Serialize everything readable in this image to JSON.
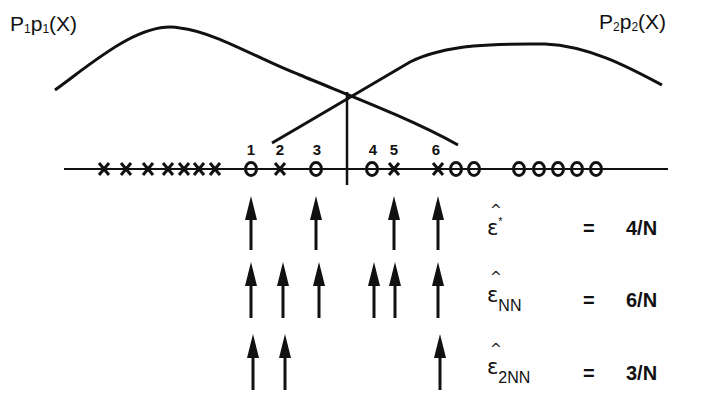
{
  "diagram": {
    "curve_labels": {
      "class1": {
        "P": "P",
        "P_sub": "1",
        "p": "p",
        "p_sub": "1",
        "arg": "(X)"
      },
      "class2": {
        "P": "P",
        "P_sub": "2",
        "p": "p",
        "p_sub": "2",
        "arg": "(X)"
      }
    },
    "axis_samples": [
      {
        "x": 104,
        "type": "X"
      },
      {
        "x": 126,
        "type": "X"
      },
      {
        "x": 148,
        "type": "X"
      },
      {
        "x": 168,
        "type": "X"
      },
      {
        "x": 184,
        "type": "X"
      },
      {
        "x": 199,
        "type": "X"
      },
      {
        "x": 215,
        "type": "X"
      },
      {
        "x": 251,
        "type": "O"
      },
      {
        "x": 280,
        "type": "X"
      },
      {
        "x": 316,
        "type": "O"
      },
      {
        "x": 372,
        "type": "O"
      },
      {
        "x": 394,
        "type": "X"
      },
      {
        "x": 438,
        "type": "X"
      },
      {
        "x": 456,
        "type": "O"
      },
      {
        "x": 474,
        "type": "O"
      },
      {
        "x": 519,
        "type": "O"
      },
      {
        "x": 539,
        "type": "O"
      },
      {
        "x": 558,
        "type": "O"
      },
      {
        "x": 577,
        "type": "O"
      },
      {
        "x": 596,
        "type": "O"
      }
    ],
    "error_indices": [
      {
        "label": "1",
        "x": 251
      },
      {
        "label": "2",
        "x": 280
      },
      {
        "label": "3",
        "x": 316
      },
      {
        "label": "4",
        "x": 372
      },
      {
        "label": "5",
        "x": 394
      },
      {
        "label": "6",
        "x": 438
      }
    ],
    "decision_boundary_x": 347,
    "estimators": [
      {
        "symbol": "ε",
        "hat": "^",
        "sup": "*",
        "sub": "",
        "equals": "=",
        "value": "4/N",
        "arrow_x": [
          251,
          316,
          394,
          438
        ]
      },
      {
        "symbol": "ε",
        "hat": "^",
        "sup": "",
        "sub": "NN",
        "equals": "=",
        "value": "6/N",
        "arrow_x": [
          251,
          283,
          319,
          374,
          395,
          438
        ]
      },
      {
        "symbol": "ε",
        "hat": "^",
        "sup": "",
        "sub": "2NN",
        "equals": "=",
        "value": "3/N",
        "arrow_x": [
          253,
          285,
          440
        ]
      }
    ]
  }
}
